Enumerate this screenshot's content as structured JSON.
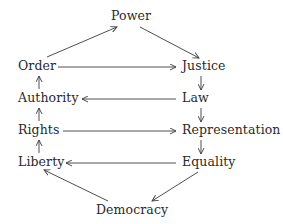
{
  "diagram": {
    "type": "directed-cycle-graph",
    "nodes": {
      "power": "Power",
      "order": "Order",
      "justice": "Justice",
      "authority": "Authority",
      "law": "Law",
      "rights": "Rights",
      "representation": "Representation",
      "liberty": "Liberty",
      "equality": "Equality",
      "democracy": "Democracy"
    },
    "edges": [
      {
        "from": "Order",
        "to": "Power"
      },
      {
        "from": "Power",
        "to": "Justice"
      },
      {
        "from": "Order",
        "to": "Justice"
      },
      {
        "from": "Justice",
        "to": "Law"
      },
      {
        "from": "Law",
        "to": "Authority"
      },
      {
        "from": "Authority",
        "to": "Order"
      },
      {
        "from": "Law",
        "to": "Representation"
      },
      {
        "from": "Rights",
        "to": "Authority"
      },
      {
        "from": "Rights",
        "to": "Representation"
      },
      {
        "from": "Representation",
        "to": "Equality"
      },
      {
        "from": "Equality",
        "to": "Liberty"
      },
      {
        "from": "Liberty",
        "to": "Rights"
      },
      {
        "from": "Equality",
        "to": "Democracy"
      },
      {
        "from": "Democracy",
        "to": "Liberty"
      }
    ],
    "colors": {
      "text": "#2a2a2a",
      "edge": "#3a3a3a",
      "background": "#ffffff"
    }
  }
}
